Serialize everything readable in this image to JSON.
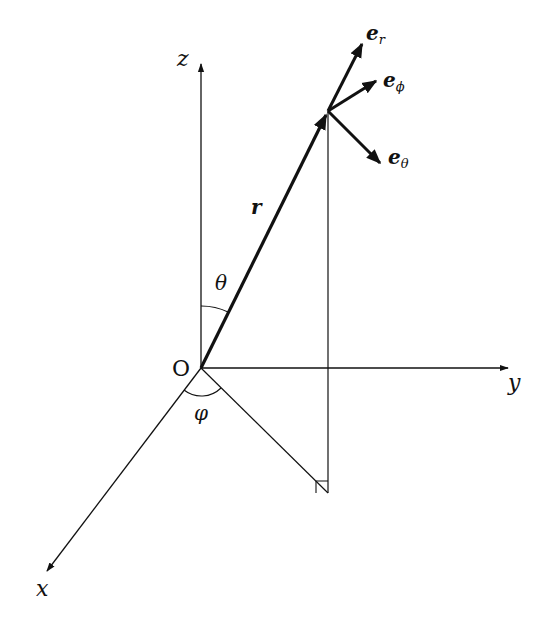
{
  "diagram": {
    "labels": {
      "origin": "O",
      "x_axis": "x",
      "y_axis": "y",
      "z_axis": "z",
      "position_vector": "r",
      "polar_angle": "θ",
      "azimuthal_angle": "φ",
      "unit_r": "e",
      "unit_r_sub": "r",
      "unit_phi": "e",
      "unit_phi_sub": "ϕ",
      "unit_theta": "e",
      "unit_theta_sub": "θ"
    },
    "colors": {
      "stroke": "#111111",
      "background": "#ffffff"
    }
  }
}
